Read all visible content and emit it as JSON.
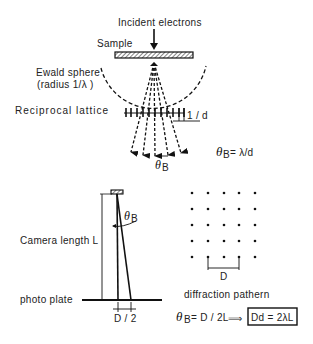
{
  "diagram": {
    "top": {
      "incident_label": "Incident electrons",
      "sample_label": "Sample",
      "ewald_label_line1": "Ewald sphere",
      "ewald_label_line2": "(radius 1/λ )",
      "reciprocal_label": "Reciprocal lattice",
      "spacing_label": "1 / d",
      "theta_symbol": "θ",
      "theta_sub": "B",
      "bragg_relation": "= λ/d"
    },
    "bottom_left": {
      "camera_label": "Camera length L",
      "plate_label": "photo plate",
      "theta_symbol": "θ",
      "theta_sub": "B",
      "half_d_label": "D / 2"
    },
    "bottom_right": {
      "pattern_label": "diffraction pathern",
      "d_label": "D",
      "grid_rows": 5,
      "grid_cols": 5
    },
    "formula": {
      "theta_symbol": "θ",
      "theta_sub": "B",
      "lhs": "= D / 2L",
      "arrow": "⟹",
      "result": "Dd = 2λL"
    }
  }
}
